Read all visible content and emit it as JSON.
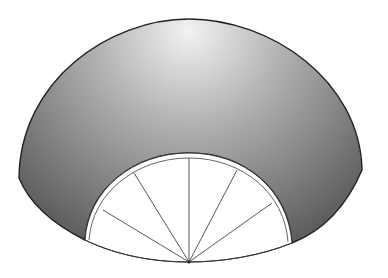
{
  "diagram": {
    "type": "fan-sector",
    "colors": {
      "background": "#ffffff",
      "shade_light": "#e6e6e6",
      "shade_dark": "#5a5a5a",
      "outline": "#222222",
      "ribs": "#444444"
    },
    "pivot": {
      "x": 189,
      "y": 262
    },
    "outer_arc": {
      "left": [
        19,
        178
      ],
      "top": [
        189,
        19
      ],
      "right": [
        362,
        170
      ]
    },
    "inner_arc": {
      "left": [
        85,
        240
      ],
      "top": [
        189,
        153
      ],
      "right": [
        292,
        243
      ]
    },
    "rib_count": 7,
    "segment_count": 8
  }
}
